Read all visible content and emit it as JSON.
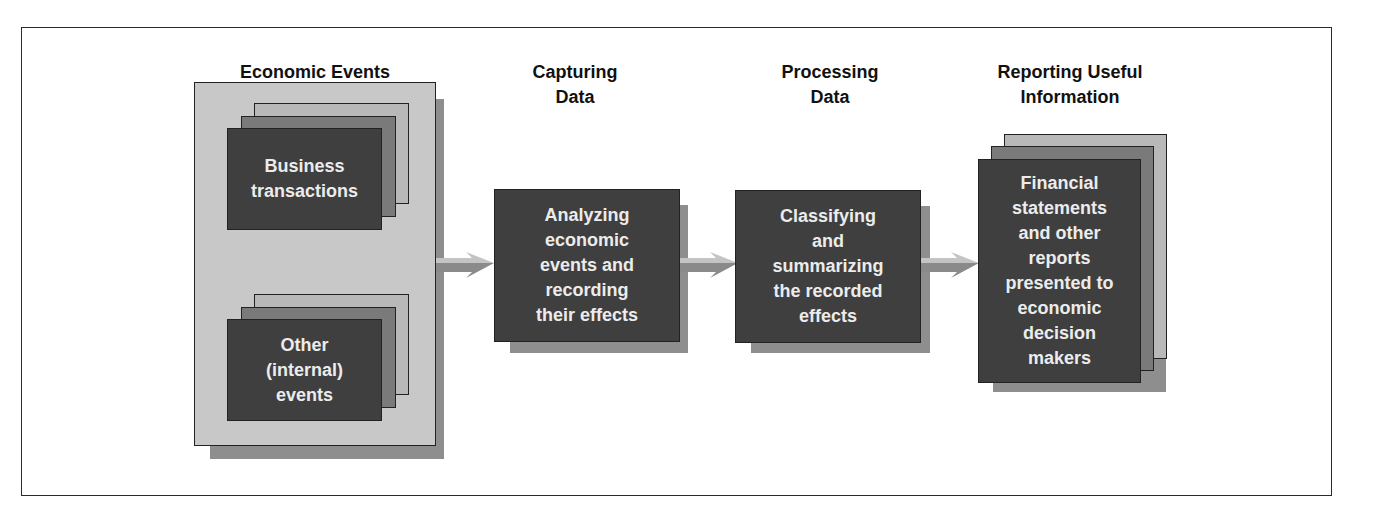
{
  "diagram": {
    "stages": [
      {
        "heading": "Economic Events",
        "items": [
          "Business\ntransactions",
          "Other\n(internal)\nevents"
        ]
      },
      {
        "heading": "Capturing\nData",
        "box": "Analyzing\neconomic\nevents and\nrecording\ntheir effects"
      },
      {
        "heading": "Processing\nData",
        "box": "Classifying\nand\nsummarizing\nthe recorded\neffects"
      },
      {
        "heading": "Reporting Useful\nInformation",
        "box": "Financial\nstatements\nand other\nreports\npresented to\neconomic\ndecision\nmakers"
      }
    ],
    "arrows": [
      "arrow-1",
      "arrow-2",
      "arrow-3"
    ],
    "colors": {
      "outer_panel": "#c8c8c8",
      "shadow": "#8e8e8e",
      "card_dark": "#3f3f3f",
      "card_mid": "#7a7a7a",
      "card_light": "#b8b8b8",
      "card_text": "#ececec",
      "arrow_light": "#c4c4c4",
      "arrow_dark": "#8a8a8a"
    }
  }
}
